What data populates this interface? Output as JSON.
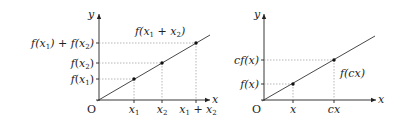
{
  "diagrams": [
    {
      "name": "additivity",
      "axis_x_label": "x",
      "axis_y_label": "y",
      "origin_label": "O",
      "x_ticks": [
        "x1",
        "x2",
        "x1 + x2"
      ],
      "y_ticks": [
        "f(x1)",
        "f(x2)",
        "f(x1) + f(x2)"
      ],
      "curve_label": "f(x1 + x2)",
      "labels": {
        "f_x1_f": "f",
        "f_x1_open": "(",
        "f_x1_x": "x",
        "f_x1_sub": "1",
        "f_x1_close": ")",
        "f_x2_f": "f",
        "f_x2_open": "(",
        "f_x2_x": "x",
        "f_x2_sub": "2",
        "f_x2_close": ")",
        "sum_a": "f(",
        "sum_x1": "x",
        "sum_sub1": "1",
        "sum_mid": ") + f(",
        "sum_x2": "x",
        "sum_sub2": "2",
        "sum_close": ")",
        "x1": "x",
        "x1_sub": "1",
        "x2": "x",
        "x2_sub": "2",
        "x12_a": "x",
        "x12_sub1": "1",
        "x12_plus": " + ",
        "x12_b": "x",
        "x12_sub2": "2",
        "curve_a": "f(",
        "curve_x1": "x",
        "curve_sub1": "1",
        "curve_plus": " + ",
        "curve_x2": "x",
        "curve_sub2": "2",
        "curve_close": ")",
        "x_axis": "x",
        "y_axis": "y",
        "origin": "O"
      }
    },
    {
      "name": "homogeneity",
      "axis_x_label": "x",
      "axis_y_label": "y",
      "origin_label": "O",
      "x_ticks": [
        "x",
        "cx"
      ],
      "y_ticks": [
        "f(x)",
        "cf(x)"
      ],
      "curve_label": "f(cx)",
      "labels": {
        "fx": "f(x)",
        "cfx": "cf(x)",
        "x": "x",
        "cx": "cx",
        "fcx": "f(cx)",
        "x_axis": "x",
        "y_axis": "y",
        "origin": "O"
      }
    }
  ]
}
